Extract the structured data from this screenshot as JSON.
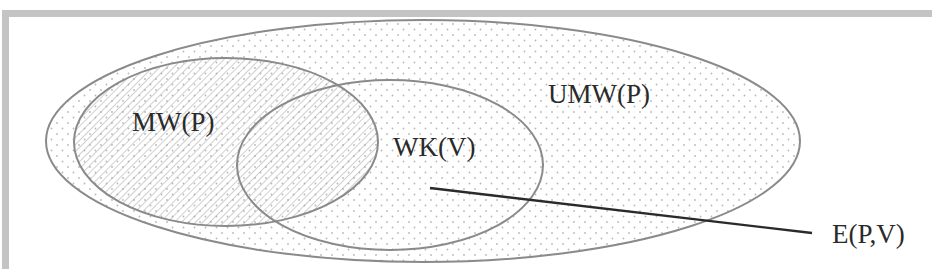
{
  "diagram": {
    "sets": [
      {
        "id": "umw",
        "label": "UMW(P)",
        "cx": 423,
        "cy": 141,
        "rx": 377,
        "ry": 121,
        "fill": "dots",
        "label_x": 548,
        "label_y": 103
      },
      {
        "id": "mw",
        "label": "MW(P)",
        "cx": 226,
        "cy": 142,
        "rx": 152,
        "ry": 84,
        "fill": "hatch",
        "label_x": 132,
        "label_y": 131
      },
      {
        "id": "wk",
        "label": "WK(V)",
        "cx": 390,
        "cy": 165,
        "rx": 153,
        "ry": 85,
        "fill": "none",
        "label_x": 393,
        "label_y": 156
      }
    ],
    "pointer": {
      "label": "E(P,V)",
      "x1": 430,
      "y1": 188,
      "x2": 812,
      "y2": 233,
      "label_x": 832,
      "label_y": 243
    },
    "colors": {
      "ellipse_stroke": "#8a8a8a",
      "line": "#2a2a2a",
      "frame": "#c4c4c4",
      "dots": "#b8b8b8",
      "hatch": "#a8a8a8"
    }
  }
}
